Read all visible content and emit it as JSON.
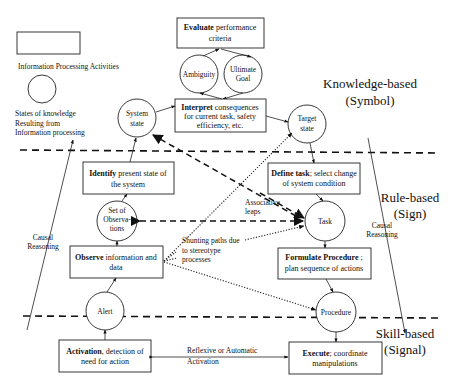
{
  "legend": {
    "activity_label": "Information Processing Activities",
    "state_label_lines": [
      "States of knowledge",
      "Resulting from",
      "Information processing"
    ]
  },
  "levels": {
    "knowledge": {
      "line1": "Knowledge-based",
      "line2": "(Symbol)"
    },
    "rule": {
      "line1": "Rule-based",
      "line2": "(Sign)"
    },
    "skill": {
      "line1": "Skill-based",
      "line2": "(Signal)"
    }
  },
  "activities": {
    "evaluate": {
      "bold": "Evaluate",
      "rest": " performance",
      "line2": "criteria"
    },
    "interpret": {
      "bold": "Interpret",
      "rest": " consequences",
      "line2": "for current task, safety",
      "line3": "efficiency, etc."
    },
    "identify": {
      "bold": "Identify",
      "rest": " present state of",
      "line2": "the system"
    },
    "define": {
      "bold": "Define task",
      "rest": "; select change",
      "line2": "of system condition"
    },
    "observe": {
      "bold": "Observe",
      "rest": " information and",
      "line2": "data"
    },
    "formulate": {
      "bold": "Formulate Procedure",
      "rest": " ;",
      "line2": "plan sequence of actions"
    },
    "activation": {
      "bold": "Activation",
      "rest": ", detection of",
      "line2": "need for action"
    },
    "execute": {
      "bold": "Execute",
      "rest": "; coordinate",
      "line2": "manipulations"
    }
  },
  "states": {
    "ambiguity": [
      "Ambiguity"
    ],
    "ultimate_goal": [
      "Ultimate",
      "Goal"
    ],
    "system_state": [
      "System",
      "state"
    ],
    "target_state": [
      "Target",
      "state"
    ],
    "set_of_observations": [
      "Set of",
      "Observa-",
      "tions"
    ],
    "task": [
      "Task"
    ],
    "alert": [
      "Alert"
    ],
    "procedure": [
      "Procedure"
    ]
  },
  "annotations": {
    "associative_leaps": [
      "Associative",
      "leaps"
    ],
    "shunting_paths": [
      "Shunting paths due",
      "to stereotype",
      "processes"
    ],
    "reflexive": [
      "Reflexive or Automatic",
      "Activation"
    ],
    "causal_left": [
      "Causal",
      "Reasoning"
    ],
    "causal_right": [
      "Causal",
      "Reasoning"
    ]
  }
}
